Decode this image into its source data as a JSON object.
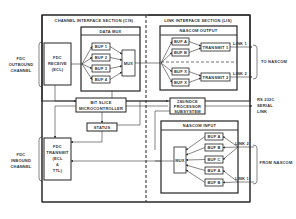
{
  "diagram": {
    "sections": {
      "cis": "CHANNEL INTERFACE SECTION (CIS)",
      "lis": "LINK INTERFACE SECTION (LIS)"
    },
    "external_labels": {
      "fdc_outbound": [
        "FDC",
        "OUTBOUND",
        "CHANNEL"
      ],
      "fdc_inbound": [
        "FDC",
        "INBOUND",
        "CHANNEL"
      ],
      "to_nascom": "TO NASCOM",
      "from_nascom": "FROM NASCOM",
      "rs232": [
        "RS 232C",
        "SERIAL",
        "LINK"
      ]
    },
    "blocks": {
      "fdc_receive": [
        "FDC",
        "RECEIVE",
        "(ECL)"
      ],
      "fdc_transmit": [
        "FDC",
        "TRANSMIT",
        "(ECL",
        "&",
        "TTL)"
      ],
      "data_mux": {
        "title": "DATA MUX",
        "buffers": [
          "BUF 1",
          "BUF 2",
          "BUF 3",
          "BUF 4"
        ],
        "mux": "MUX"
      },
      "bit_slice": [
        "BIT SLICE",
        "MICROCONTROLLER"
      ],
      "status": "STATUS",
      "z80": [
        "Z80/NDCE",
        "PROCESSOR",
        "SUBSYSTEM"
      ],
      "nascom_output": {
        "title": "NASCOM OUTPUT",
        "buffers": [
          "BUF A",
          "BUF B",
          "BUF X",
          "BUF X"
        ],
        "transmitters": [
          "TRANSMIT 1",
          "TRANSMIT 2"
        ],
        "links": [
          "LINK 1",
          "LINK 2"
        ]
      },
      "nascom_input": {
        "title": "NASCOM INPUT",
        "mux": "MUX",
        "buffers": [
          "BUF A",
          "BUF B",
          "BUF C",
          "BUF A",
          "BUF B"
        ],
        "links": [
          "LINK 2",
          "LINK 1"
        ]
      }
    }
  }
}
